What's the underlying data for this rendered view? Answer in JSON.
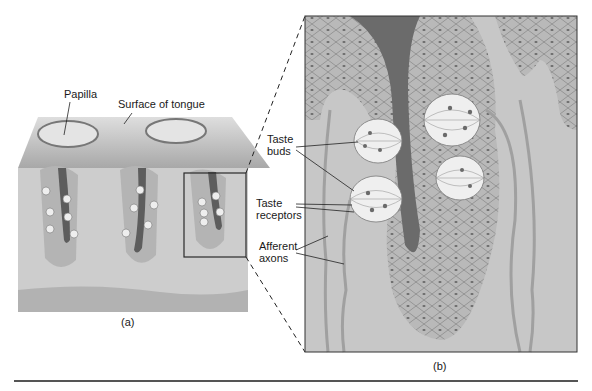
{
  "figure": {
    "panel_a": {
      "caption": "(a)",
      "labels": {
        "papilla": "Papilla",
        "surface": "Surface of tongue"
      }
    },
    "panel_b": {
      "caption": "(b)",
      "labels": {
        "taste_buds": [
          "Taste",
          "buds"
        ],
        "taste_receptors": [
          "Taste",
          "receptors"
        ],
        "afferent_axons": [
          "Afferent",
          "axons"
        ]
      }
    },
    "colors": {
      "tissue_light": "#c9c9c9",
      "tissue_mid": "#b3b3b3",
      "tissue_dark": "#6e6e6e",
      "cell_bud": "#eeeeee",
      "rule": "#555555"
    }
  }
}
